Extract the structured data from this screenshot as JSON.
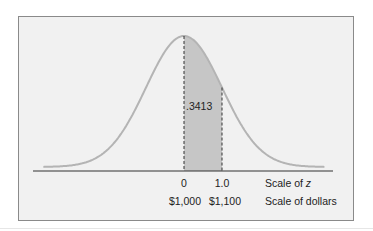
{
  "chart_data": {
    "type": "area",
    "title": "",
    "distribution": {
      "mean_z": 0,
      "sd_z": 1,
      "mean_dollars": 1000,
      "sd_dollars": 100
    },
    "shaded_region": {
      "z_from": 0,
      "z_to": 1.0,
      "dollars_from": 1000,
      "dollars_to": 1100,
      "area": 0.3413
    },
    "area_label": ".3413",
    "x_axes": [
      {
        "name": "Scale of z",
        "ticks": [
          {
            "value": 0,
            "label": "0"
          },
          {
            "value": 1.0,
            "label": "1.0"
          }
        ]
      },
      {
        "name": "Scale of dollars",
        "ticks": [
          {
            "value": 1000,
            "label": "$1,000"
          },
          {
            "value": 1100,
            "label": "$1,100"
          }
        ]
      }
    ],
    "xlim_z": [
      -3.7,
      3.7
    ],
    "grid": false,
    "legend": null
  },
  "labels": {
    "area": ".3413",
    "z_tick_0": "0",
    "z_tick_1": "1.0",
    "z_scale_prefix": "Scale of ",
    "z_scale_var": "z",
    "dollar_tick_0": "$1,000",
    "dollar_tick_1": "$1,100",
    "dollar_scale": "Scale of dollars"
  },
  "colors": {
    "background": "#f1f1f1",
    "curve": "#b4b4b4",
    "shaded": "#c6c6c6",
    "axis": "#333333",
    "dashed": "#333333"
  }
}
